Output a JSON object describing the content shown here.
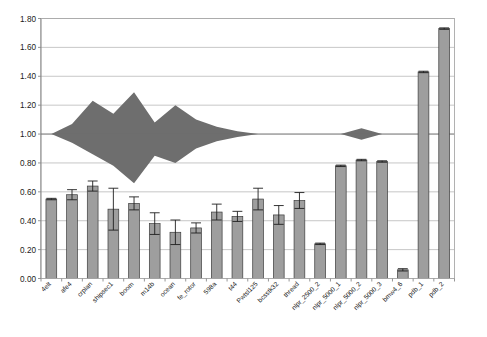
{
  "chart_data": {
    "type": "bar",
    "title": "",
    "subtitle": "",
    "xlabel": "",
    "ylabel": "",
    "ylim": [
      0.0,
      1.8
    ],
    "yticks": [
      "0.00",
      "0.20",
      "0.40",
      "0.60",
      "0.80",
      "1.00",
      "1.20",
      "1.40",
      "1.60",
      "1.80"
    ],
    "ytick_values": [
      0.0,
      0.2,
      0.4,
      0.6,
      0.8,
      1.0,
      1.2,
      1.4,
      1.6,
      1.8
    ],
    "grid": true,
    "legend": "none",
    "categories": [
      "4elt",
      "afe4",
      "crplan",
      "shipsec1",
      "boom",
      "m14b",
      "ocean",
      "fe_rotor",
      "598a",
      "t44",
      "Pwtsl125",
      "bcsstk32",
      "thread",
      "nlpr_2500_2",
      "nlpr_5000_1",
      "nlpr_5000_2",
      "nlpr_5000_3",
      "bmw4_6",
      "pdb_1",
      "pdb_2"
    ],
    "values": [
      0.55,
      0.58,
      0.64,
      0.48,
      0.52,
      0.38,
      0.32,
      0.35,
      0.46,
      0.43,
      0.55,
      0.44,
      0.54,
      0.24,
      0.78,
      0.82,
      0.81,
      0.06,
      1.43,
      1.73
    ],
    "error_upper": [
      0.555,
      0.615,
      0.675,
      0.625,
      0.565,
      0.455,
      0.405,
      0.385,
      0.515,
      0.465,
      0.625,
      0.505,
      0.595,
      0.245,
      0.785,
      0.825,
      0.815,
      0.068,
      1.435,
      1.735
    ],
    "error_lower": [
      0.545,
      0.545,
      0.605,
      0.335,
      0.475,
      0.305,
      0.235,
      0.315,
      0.405,
      0.395,
      0.475,
      0.375,
      0.485,
      0.235,
      0.775,
      0.815,
      0.805,
      0.052,
      1.425,
      1.725
    ],
    "band_series": {
      "name": "envelope",
      "upper": [
        1.0,
        1.07,
        1.23,
        1.14,
        1.29,
        1.08,
        1.2,
        1.1,
        1.05,
        1.02,
        1.0,
        1.0,
        1.0,
        1.0,
        1.0,
        1.04,
        1.0,
        1.0,
        1.0,
        1.0
      ],
      "lower": [
        1.0,
        0.94,
        0.86,
        0.78,
        0.66,
        0.85,
        0.8,
        0.9,
        0.95,
        0.98,
        1.0,
        1.0,
        1.0,
        1.0,
        1.0,
        0.96,
        1.0,
        1.0,
        1.0,
        1.0
      ],
      "baseline": 1.0
    },
    "reference_line": 1.0,
    "bar_color": "#9e9e9e",
    "bar_edge_color": "#3c3c3c",
    "band_color": "#6e6e6e",
    "grid_color": "#b9b9b9",
    "background_color": "#ffffff"
  }
}
